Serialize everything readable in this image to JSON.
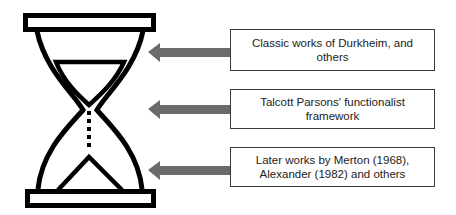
{
  "diagram": {
    "type": "hourglass-timeline",
    "colors": {
      "hourglass_stroke": "#000000",
      "arrow_fill": "#6b6b6b",
      "box_border": "#3a3a3a",
      "text": "#222222"
    },
    "labels": [
      {
        "id": "top",
        "text": "Classic works of Durkheim, and others"
      },
      {
        "id": "middle",
        "text": "Talcott Parsons' functionalist framework"
      },
      {
        "id": "bottom",
        "text": "Later works by Merton (1968), Alexander (1982) and others"
      }
    ]
  }
}
